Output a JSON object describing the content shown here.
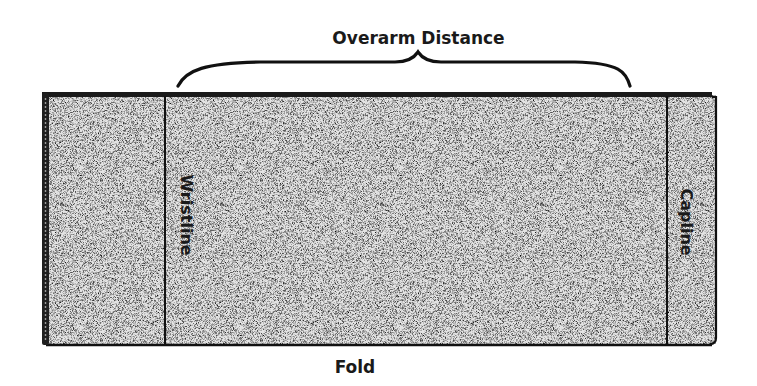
{
  "diagram": {
    "title": "Overarm Distance",
    "bottom_label": "Fold",
    "left_panel_label": "Wristline",
    "right_panel_label": "Capline",
    "colors": {
      "outline": "#111111",
      "fill_texture": "#d6d6d6",
      "text": "#1a1a1a"
    }
  }
}
